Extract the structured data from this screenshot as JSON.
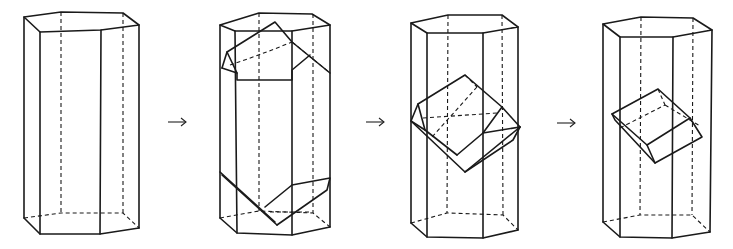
{
  "figure": {
    "stage_count": 4,
    "arrow_glyph": "→",
    "colors": {
      "line": "#1a1a1a",
      "background": "#ffffff"
    }
  },
  "stages": [
    {
      "id": "stage-1",
      "label": "hexagonal prism"
    },
    {
      "id": "stage-2",
      "label": "prism with truncated crystal ends"
    },
    {
      "id": "stage-3",
      "label": "prism with tilted inner crystal"
    },
    {
      "id": "stage-4",
      "label": "prism with smaller tilted inner crystal"
    }
  ],
  "arrows": [
    {
      "id": "arrow-1",
      "x1": 168,
      "x2": 186,
      "y": 122
    },
    {
      "id": "arrow-2",
      "x1": 366,
      "x2": 384,
      "y": 122
    },
    {
      "id": "arrow-3",
      "x1": 557,
      "x2": 575,
      "y": 123
    }
  ]
}
